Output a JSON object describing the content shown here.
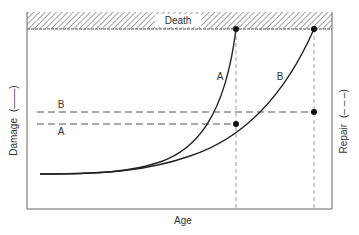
{
  "diagram": {
    "band_label": "Death",
    "x_axis_label": "Age",
    "left_axis_label": "Damage",
    "left_axis_legend": "(——)",
    "right_axis_label": "Repair",
    "right_axis_legend": "(– – –)",
    "curves": [
      {
        "name": "A",
        "label": "A",
        "type": "damage",
        "style": "solid",
        "endpoint": [
          236,
          29
        ]
      },
      {
        "name": "B",
        "label": "B",
        "type": "damage",
        "style": "solid",
        "endpoint": [
          314,
          29
        ]
      }
    ],
    "repair_levels": [
      {
        "name": "B",
        "label": "B",
        "style": "dashed",
        "y": 112,
        "endpoint": [
          314,
          112
        ]
      },
      {
        "name": "A",
        "label": "A",
        "style": "dashed",
        "y": 124,
        "endpoint": [
          236,
          124
        ]
      }
    ],
    "colors": {
      "line": "#222222",
      "frame": "#555555",
      "hatch": "#888888",
      "text": "#333333",
      "dashed": "#777777"
    }
  }
}
